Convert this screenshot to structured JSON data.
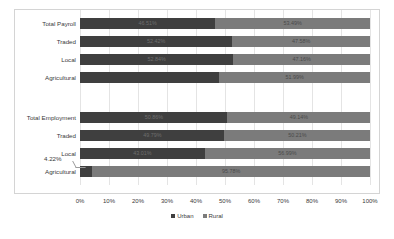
{
  "chart_data": {
    "type": "bar",
    "subtype": "stacked-bar-horizontal-100pct",
    "title": "",
    "xlabel": "",
    "ylabel": "",
    "xlim": [
      0,
      100
    ],
    "xticks": [
      "0%",
      "10%",
      "20%",
      "30%",
      "40%",
      "50%",
      "60%",
      "70%",
      "80%",
      "90%",
      "100%"
    ],
    "grid": true,
    "orientation": "horizontal",
    "stacked": true,
    "legend": {
      "position": "bottom-center",
      "entries": [
        {
          "name": "Urban",
          "color": "#3f3f3f"
        },
        {
          "name": "Rural",
          "color": "#7b7b7b"
        }
      ]
    },
    "series": [
      {
        "name": "Urban",
        "color": "#3f3f3f",
        "values": [
          46.51,
          52.42,
          52.84,
          48.01,
          50.86,
          49.79,
          43.01,
          4.22
        ]
      },
      {
        "name": "Rural",
        "color": "#7b7b7b",
        "values": [
          53.49,
          47.58,
          47.16,
          51.99,
          49.14,
          50.21,
          56.99,
          95.78
        ]
      }
    ],
    "groups": [
      {
        "name": "Payroll",
        "categories": [
          "Total Payroll",
          "Traded",
          "Local",
          "Agricultural"
        ]
      },
      {
        "name": "Employment",
        "categories": [
          "Total Employment",
          "Traded",
          "Local",
          "Agricultural"
        ]
      }
    ],
    "categories": [
      "Total Payroll",
      "Traded",
      "Local",
      "Agricultural",
      "Total Employment",
      "Traded",
      "Local",
      "Agricultural"
    ],
    "annotations": [
      {
        "text": "4.22%",
        "refers_to": "Agricultural Urban (Employment)"
      }
    ]
  },
  "rows": [
    {
      "label": "Total Payroll",
      "urban": "46.51%",
      "rural": "53.49%",
      "urban_value": 46.51,
      "rural_value": 53.49,
      "show_urban_label": true,
      "show_rural_label": true,
      "top": 18,
      "group": 0
    },
    {
      "label": "Traded",
      "urban": "52.42%",
      "rural": "47.58%",
      "urban_value": 52.42,
      "rural_value": 47.58,
      "show_urban_label": true,
      "show_rural_label": true,
      "top": 36,
      "group": 0
    },
    {
      "label": "Local",
      "urban": "52.84%",
      "rural": "47.16%",
      "urban_value": 52.84,
      "rural_value": 47.16,
      "show_urban_label": true,
      "show_rural_label": true,
      "top": 54,
      "group": 0
    },
    {
      "label": "Agricultural",
      "urban": "48.01%",
      "rural": "51.99%",
      "urban_value": 48.01,
      "rural_value": 51.99,
      "show_urban_label": false,
      "show_rural_label": true,
      "top": 72,
      "group": 0
    },
    {
      "label": "Total Employment",
      "urban": "50.86%",
      "rural": "49.14%",
      "urban_value": 50.86,
      "rural_value": 49.14,
      "show_urban_label": true,
      "show_rural_label": true,
      "top": 112,
      "group": 1
    },
    {
      "label": "Traded",
      "urban": "49.79%",
      "rural": "50.21%",
      "urban_value": 49.79,
      "rural_value": 50.21,
      "show_urban_label": true,
      "show_rural_label": true,
      "top": 130,
      "group": 1
    },
    {
      "label": "Local",
      "urban": "43.01%",
      "rural": "56.99%",
      "urban_value": 43.01,
      "rural_value": 56.99,
      "show_urban_label": true,
      "show_rural_label": true,
      "top": 148,
      "group": 1
    },
    {
      "label": "Agricultural",
      "urban": "4.22%",
      "rural": "95.78%",
      "urban_value": 4.22,
      "rural_value": 95.78,
      "show_urban_label": false,
      "show_rural_label": true,
      "top": 166,
      "group": 1
    }
  ],
  "axis": {
    "ticks": [
      "0%",
      "10%",
      "20%",
      "30%",
      "40%",
      "50%",
      "60%",
      "70%",
      "80%",
      "90%",
      "100%"
    ]
  },
  "legend": {
    "urban": "Urban",
    "rural": "Rural"
  },
  "callout": {
    "text": "4.22%"
  },
  "colors": {
    "urban": "#3f3f3f",
    "rural": "#7b7b7b",
    "border": "#d4d4d4",
    "grid": "#e4e4e4",
    "text": "#3a3a3a"
  }
}
